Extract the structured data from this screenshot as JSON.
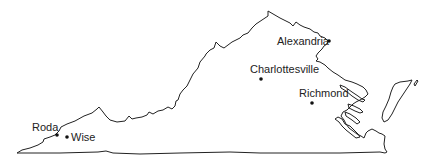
{
  "map": {
    "region": "Virginia",
    "colors": {
      "outline": "#222222",
      "text": "#222222",
      "background": "#ffffff"
    },
    "cities": [
      {
        "name": "Alexandria",
        "dot": [
          329,
          41
        ],
        "label": [
          277,
          45
        ],
        "anchor": "start"
      },
      {
        "name": "Charlottesville",
        "dot": [
          261,
          79
        ],
        "label": [
          250,
          73
        ],
        "anchor": "start"
      },
      {
        "name": "Richmond",
        "dot": [
          312,
          103
        ],
        "label": [
          299,
          97
        ],
        "anchor": "start"
      },
      {
        "name": "Roda",
        "dot": [
          57,
          135
        ],
        "label": [
          32,
          131
        ],
        "anchor": "start"
      },
      {
        "name": "Wise",
        "dot": [
          67,
          137
        ],
        "label": [
          71,
          141
        ],
        "anchor": "start"
      }
    ]
  }
}
